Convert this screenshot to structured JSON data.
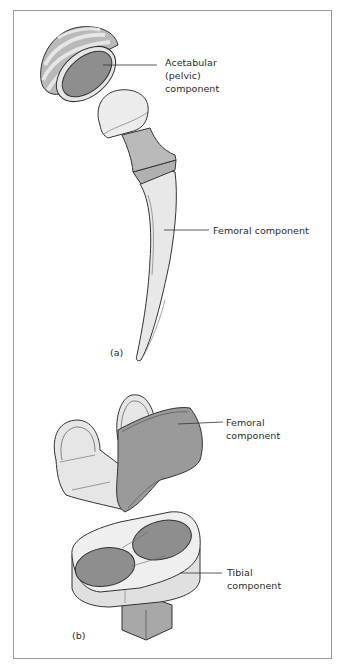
{
  "figure": {
    "panels": [
      {
        "id": "a",
        "label": "(a)",
        "subject": "hip-prosthesis",
        "callouts": [
          {
            "lines": [
              "Acetabular",
              "(pelvic)",
              "component"
            ]
          },
          {
            "lines": [
              "Femoral component"
            ]
          }
        ]
      },
      {
        "id": "b",
        "label": "(b)",
        "subject": "knee-prosthesis",
        "callouts": [
          {
            "lines": [
              "Femoral",
              "component"
            ]
          },
          {
            "lines": [
              "Tibial",
              "component"
            ]
          }
        ]
      }
    ],
    "colors": {
      "outline": "#333333",
      "dark_fill": "#8e8e8e",
      "mid_fill": "#b9b9b9",
      "light_fill": "#e6e6e6",
      "frame": "#9a9a9a"
    }
  }
}
